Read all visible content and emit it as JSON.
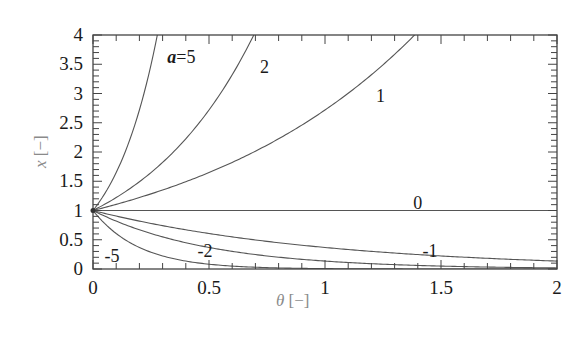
{
  "chart_data": {
    "type": "line",
    "title": "",
    "xlabel": "θ [−]",
    "ylabel": "x [−]",
    "xlabel_parts": {
      "var": "θ",
      "unit": " [−]"
    },
    "ylabel_parts": {
      "var": "x",
      "unit": " [−]"
    },
    "xlim": [
      0,
      2
    ],
    "ylim": [
      0,
      4
    ],
    "x_ticks": [
      0,
      0.5,
      1,
      1.5,
      2
    ],
    "x_tick_labels": [
      "0",
      "0.5",
      "1",
      "1.5",
      "2"
    ],
    "y_ticks": [
      0,
      0.5,
      1,
      1.5,
      2,
      2.5,
      3,
      3.5,
      4
    ],
    "y_tick_labels": [
      "0",
      "0.5",
      "1",
      "1.5",
      "2",
      "2.5",
      "3",
      "3.5",
      "4"
    ],
    "x_minor_step": 0.1,
    "y_minor_step": 0.1,
    "grid": false,
    "legend": "none (curves labeled inline)",
    "formula": "x = exp(a·θ)",
    "series": [
      {
        "name": "a=5",
        "a": 5,
        "label": "a=5",
        "label_at": [
          0.32,
          3.62
        ],
        "x": [
          0,
          0.05,
          0.1,
          0.15,
          0.2,
          0.25,
          0.277
        ],
        "y": [
          1,
          1.28,
          1.65,
          2.12,
          2.72,
          3.49,
          4.0
        ]
      },
      {
        "name": "a=2",
        "a": 2,
        "label": "2",
        "label_at": [
          0.72,
          3.45
        ],
        "x": [
          0,
          0.1,
          0.2,
          0.3,
          0.4,
          0.5,
          0.6,
          0.693
        ],
        "y": [
          1,
          1.22,
          1.49,
          1.82,
          2.23,
          2.72,
          3.32,
          4.0
        ]
      },
      {
        "name": "a=1",
        "a": 1,
        "label": "1",
        "label_at": [
          1.22,
          2.95
        ],
        "x": [
          0,
          0.2,
          0.4,
          0.6,
          0.8,
          1.0,
          1.2,
          1.386
        ],
        "y": [
          1,
          1.22,
          1.49,
          1.82,
          2.23,
          2.72,
          3.32,
          4.0
        ]
      },
      {
        "name": "a=0",
        "a": 0,
        "label": "0",
        "label_at": [
          1.38,
          1.12
        ],
        "x": [
          0,
          2
        ],
        "y": [
          1,
          1
        ]
      },
      {
        "name": "a=-1",
        "a": -1,
        "label": "-1",
        "label_at": [
          1.42,
          0.3
        ],
        "x": [
          0,
          0.25,
          0.5,
          0.75,
          1.0,
          1.25,
          1.5,
          1.75,
          2.0
        ],
        "y": [
          1,
          0.78,
          0.61,
          0.47,
          0.37,
          0.29,
          0.22,
          0.17,
          0.14
        ]
      },
      {
        "name": "a=-2",
        "a": -2,
        "label": "-2",
        "label_at": [
          0.45,
          0.3
        ],
        "x": [
          0,
          0.25,
          0.5,
          0.75,
          1.0,
          1.25,
          1.5,
          1.75,
          2.0
        ],
        "y": [
          1,
          0.61,
          0.37,
          0.22,
          0.14,
          0.08,
          0.05,
          0.03,
          0.02
        ]
      },
      {
        "name": "a=-5",
        "a": -5,
        "label": "-5",
        "label_at": [
          0.05,
          0.23
        ],
        "x": [
          0,
          0.1,
          0.2,
          0.3,
          0.4,
          0.5,
          0.6,
          0.8,
          1.0,
          2.0
        ],
        "y": [
          1,
          0.61,
          0.37,
          0.22,
          0.14,
          0.08,
          0.05,
          0.02,
          0.01,
          0.0
        ]
      }
    ]
  }
}
